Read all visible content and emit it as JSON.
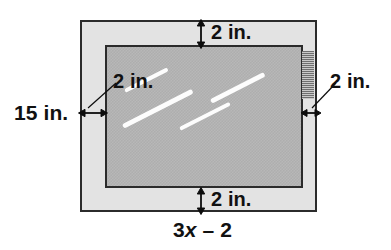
{
  "figure": {
    "colors": {
      "bezel_fill": "#e3e3e3",
      "screen_fill": "#b4b4b4",
      "outline": "#2b2b2b",
      "arrow": "#0d0d0d",
      "glare": "#ffffff",
      "speaker_dark": "#6f6f6f",
      "speaker_light": "#c9c9c9",
      "background": "#ffffff",
      "text": "#111111"
    }
  },
  "labels": {
    "top_margin": "2 in.",
    "bottom_margin": "2 in.",
    "left_margin": "2 in.",
    "right_margin": "2 in.",
    "height": "15 in.",
    "width_expression": {
      "coefficient": "3",
      "variable": "x",
      "operator": "–",
      "constant": "2",
      "full": "3x – 2"
    }
  },
  "measurements": {
    "border_width_in": 2,
    "total_height_in": 15,
    "total_width_expression": "3x - 2",
    "unit": "in."
  },
  "parts": {
    "outer_frame": "television-bezel",
    "inner_region": "television-screen",
    "speaker": "speaker-grille",
    "glare_count": 4
  }
}
